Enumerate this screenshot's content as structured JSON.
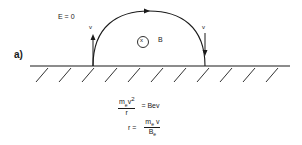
{
  "figure": {
    "part_label": "a)",
    "field_condition": "E = 0",
    "magnetic_field_label": "B",
    "magnetic_field_symbol": "x",
    "velocity_left_label": "v",
    "velocity_right_label": "v",
    "equations": {
      "eq1": {
        "numerator": "m",
        "numerator_sub": "e",
        "numerator_tail": "v",
        "numerator_sup": "2",
        "denominator": "r",
        "rhs": "= Bev"
      },
      "eq2": {
        "lhs": "r  =",
        "numerator": "m",
        "numerator_sub": "e",
        "numerator_tail": " v",
        "denominator": "B",
        "denominator_sub": "e"
      }
    },
    "colors": {
      "ink": "#1a1a1a",
      "background": "#ffffff"
    }
  }
}
